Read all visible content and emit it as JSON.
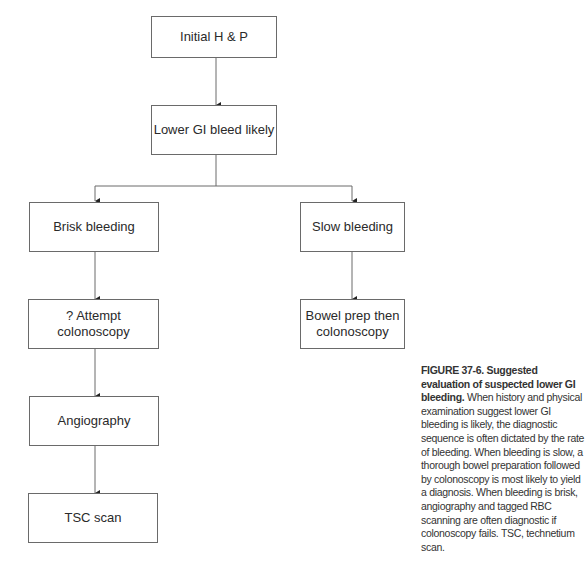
{
  "diagram": {
    "nodes": [
      {
        "id": "initial",
        "label": "Initial H & P"
      },
      {
        "id": "lower_gi",
        "label": "Lower GI bleed likely"
      },
      {
        "id": "brisk",
        "label": "Brisk bleeding"
      },
      {
        "id": "slow",
        "label": "Slow bleeding"
      },
      {
        "id": "attempt_colonoscopy",
        "label": "? Attempt colonoscopy"
      },
      {
        "id": "bowel_prep",
        "label": "Bowel prep then colonoscopy"
      },
      {
        "id": "angiography",
        "label": "Angiography"
      },
      {
        "id": "tsc_scan",
        "label": "TSC scan"
      }
    ],
    "edges": [
      {
        "from": "initial",
        "to": "lower_gi"
      },
      {
        "from": "lower_gi",
        "to": "brisk"
      },
      {
        "from": "lower_gi",
        "to": "slow"
      },
      {
        "from": "brisk",
        "to": "attempt_colonoscopy"
      },
      {
        "from": "slow",
        "to": "bowel_prep"
      },
      {
        "from": "attempt_colonoscopy",
        "to": "angiography"
      },
      {
        "from": "angiography",
        "to": "tsc_scan"
      }
    ],
    "bowel_prep_lines": [
      "Bowel prep then",
      "colonoscopy"
    ]
  },
  "caption": {
    "label": "FIGURE 37-6.",
    "title": "Suggested evaluation of suspected lower GI bleeding.",
    "body": "When history and physical examination suggest lower GI bleeding is likely, the diagnostic sequence is often dictated by the rate of bleeding. When bleeding is slow, a thorough bowel preparation followed by colonoscopy is most likely to yield a diagnosis. When bleeding is brisk, angiography and tagged RBC scanning are often diagnostic if colonoscopy fails. TSC, technetium scan."
  }
}
